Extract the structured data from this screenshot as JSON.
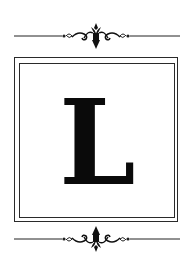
{
  "monogram": {
    "letter": "L"
  },
  "ornaments": {
    "top": "flourish-divider",
    "bottom": "flourish-divider"
  },
  "colors": {
    "ink": "#0a0a0a",
    "frame": "#2a2a2a",
    "background": "#ffffff"
  }
}
